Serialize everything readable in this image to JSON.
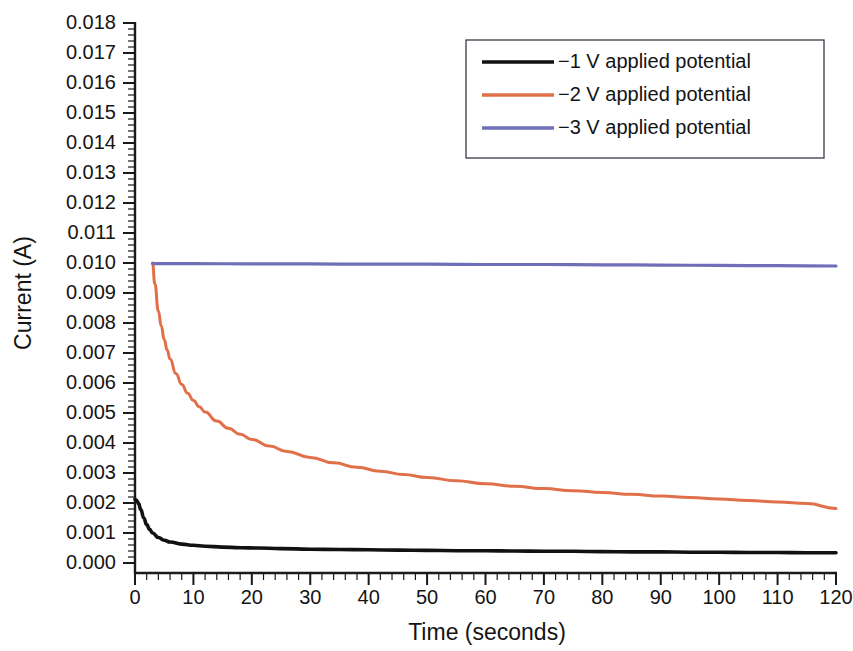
{
  "chart_data": {
    "type": "line",
    "title": "",
    "xlabel": "Time (seconds)",
    "ylabel": "Current (A)",
    "xlim": [
      0,
      120
    ],
    "ylim": [
      0,
      0.018
    ],
    "grid": false,
    "legend_position": "top-right",
    "x_ticks": [
      "0",
      "10",
      "20",
      "30",
      "40",
      "50",
      "60",
      "70",
      "80",
      "90",
      "100",
      "110",
      "120"
    ],
    "x_tick_values": [
      0,
      10,
      20,
      30,
      40,
      50,
      60,
      70,
      80,
      90,
      100,
      110,
      120
    ],
    "x_minor_step": 2,
    "y_ticks": [
      "0.000",
      "0.001",
      "0.002",
      "0.003",
      "0.004",
      "0.005",
      "0.006",
      "0.007",
      "0.008",
      "0.009",
      "0.010",
      "0.011",
      "0.012",
      "0.013",
      "0.014",
      "0.015",
      "0.016",
      "0.017",
      "0.018"
    ],
    "y_tick_values": [
      0,
      0.001,
      0.002,
      0.003,
      0.004,
      0.005,
      0.006,
      0.007,
      0.008,
      0.009,
      0.01,
      0.011,
      0.012,
      0.013,
      0.014,
      0.015,
      0.016,
      0.017,
      0.018
    ],
    "y_minor_step": 0.0002,
    "series": [
      {
        "name": "−1 V applied potential",
        "color": "#111111",
        "x": [
          0,
          0.3,
          0.6,
          1,
          1.5,
          2,
          2.5,
          3,
          4,
          5,
          6,
          8,
          10,
          12,
          15,
          18,
          21,
          25,
          30,
          35,
          40,
          45,
          50,
          55,
          60,
          65,
          70,
          75,
          80,
          85,
          90,
          95,
          100,
          105,
          110,
          115,
          120
        ],
        "values": [
          0.00212,
          0.00208,
          0.00198,
          0.00178,
          0.0015,
          0.00128,
          0.00112,
          0.001,
          0.00085,
          0.00076,
          0.0007,
          0.00063,
          0.00059,
          0.00056,
          0.00053,
          0.00051,
          0.0005,
          0.00048,
          0.00046,
          0.00045,
          0.00044,
          0.00043,
          0.00042,
          0.00041,
          0.00041,
          0.0004,
          0.00039,
          0.00039,
          0.00038,
          0.00037,
          0.00037,
          0.00036,
          0.00036,
          0.00035,
          0.00035,
          0.00034,
          0.00034
        ]
      },
      {
        "name": "−2 V applied potential",
        "color": "#e0704a",
        "x": [
          3.0,
          3.4,
          4,
          4.5,
          5,
          5.5,
          6,
          7,
          8,
          9,
          10,
          11,
          12,
          14,
          16,
          18,
          20,
          23,
          26,
          30,
          34,
          38,
          42,
          46,
          50,
          55,
          60,
          65,
          70,
          75,
          80,
          85,
          90,
          95,
          100,
          105,
          110,
          115,
          120
        ],
        "values": [
          0.01,
          0.0093,
          0.0084,
          0.0079,
          0.00745,
          0.0071,
          0.0068,
          0.00632,
          0.00595,
          0.00566,
          0.00542,
          0.00521,
          0.00503,
          0.00473,
          0.00449,
          0.00429,
          0.00412,
          0.0039,
          0.00372,
          0.00352,
          0.00334,
          0.00319,
          0.00306,
          0.00295,
          0.00285,
          0.00274,
          0.00264,
          0.00256,
          0.00248,
          0.00241,
          0.00235,
          0.00229,
          0.00223,
          0.00218,
          0.00213,
          0.00208,
          0.00203,
          0.00198,
          0.00182
        ]
      },
      {
        "name": "−3 V applied potential",
        "color": "#6f6fb8",
        "x": [
          3.0,
          10,
          20,
          30,
          40,
          50,
          60,
          70,
          80,
          90,
          100,
          110,
          120
        ],
        "values": [
          0.00998,
          0.00998,
          0.00997,
          0.00997,
          0.00996,
          0.00996,
          0.00995,
          0.00995,
          0.00994,
          0.00993,
          0.00992,
          0.00991,
          0.0099
        ]
      }
    ]
  },
  "legend": {
    "entries": [
      {
        "label": "−1 V applied potential",
        "color": "#111111"
      },
      {
        "label": "−2 V applied potential",
        "color": "#e0704a"
      },
      {
        "label": "−3 V applied potential",
        "color": "#6f6fb8"
      }
    ]
  }
}
